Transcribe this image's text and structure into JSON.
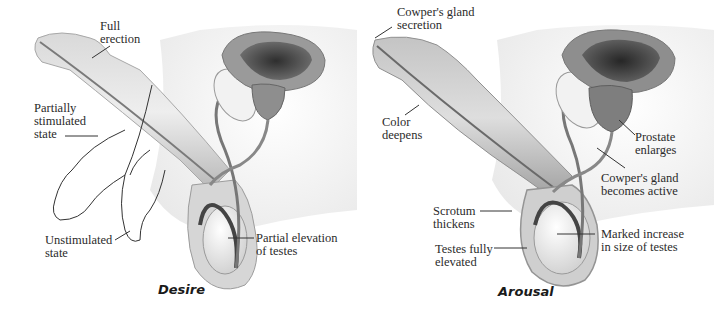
{
  "figure": {
    "panels": [
      {
        "id": "desire",
        "caption": "Desire",
        "labels": {
          "full_erection": "Full\nerection",
          "partially_stimulated": "Partially\nstimulated\nstate",
          "unstimulated": "Unstimulated\nstate",
          "partial_elevation": "Partial elevation\nof testes"
        }
      },
      {
        "id": "arousal",
        "caption": "Arousal",
        "labels": {
          "cowpers_secretion": "Cowper's gland\nsecretion",
          "color_deepens": "Color\ndeepens",
          "prostate_enlarges": "Prostate\nenlarges",
          "cowpers_active": "Cowper's gland\nbecomes active",
          "scrotum_thickens": "Scrotum\nthickens",
          "marked_increase": "Marked increase\nin size of testes",
          "testes_elevated": "Testes fully\nelevated"
        }
      }
    ],
    "colors": {
      "skin_light": "#e8e8e8",
      "skin_mid": "#bdbdbd",
      "skin_dark": "#8a8a8a",
      "bladder_dark": "#3a3a3a",
      "line": "#333333"
    }
  }
}
